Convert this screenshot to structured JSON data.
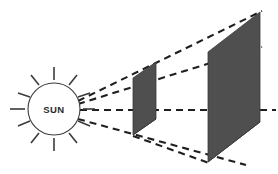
{
  "figure": {
    "label_sun": "SUN",
    "colors": {
      "panel_fill": "#4f4f4f",
      "panel_stroke": "#3a3a3a",
      "ray_color": "#1f1f1f",
      "sun_outline": "#3b3b3b",
      "background": "#ffffff",
      "text": "#2b2b2b"
    },
    "sun": {
      "name": "sun",
      "center_x": 54,
      "center_y": 109,
      "radius": 26,
      "ray_count": 12,
      "ray_length": 13,
      "ray_gap": 3
    },
    "panels": [
      {
        "name": "near-screen",
        "points": "133,135 133,78 156,62 156,119",
        "width_label": "small",
        "order": 1
      },
      {
        "name": "far-screen",
        "points": "208,162 208,52 260,12 260,122",
        "width_label": "large",
        "order": 2
      }
    ],
    "rays": [
      {
        "name": "ray-upper-outer",
        "points": "78,101 262,11"
      },
      {
        "name": "ray-upper-inner",
        "points": "78,104 262,47"
      },
      {
        "name": "ray-center",
        "points": "80,110 275,110"
      },
      {
        "name": "ray-lower",
        "points": "78,119 246,164"
      },
      {
        "name": "ray-base",
        "points": "133,136 208,163"
      }
    ],
    "hidden_edges": [
      {
        "name": "edge-near-bottom",
        "points": "133,135 156,119"
      },
      {
        "name": "edge-far-bottom",
        "points": "208,162 260,122"
      }
    ]
  }
}
